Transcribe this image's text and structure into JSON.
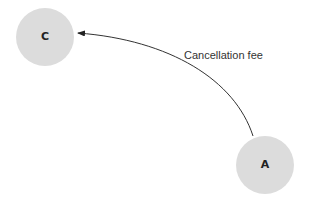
{
  "diagram": {
    "nodes": [
      {
        "id": "C",
        "label": "C",
        "cx": 45,
        "cy": 37,
        "r": 29,
        "fill": "#dcdcdc"
      },
      {
        "id": "A",
        "label": "A",
        "cx": 265,
        "cy": 165,
        "r": 29,
        "fill": "#dcdcdc"
      }
    ],
    "edges": [
      {
        "from": "A",
        "to": "C",
        "label": "Cancellation fee",
        "color": "#333333"
      }
    ]
  }
}
